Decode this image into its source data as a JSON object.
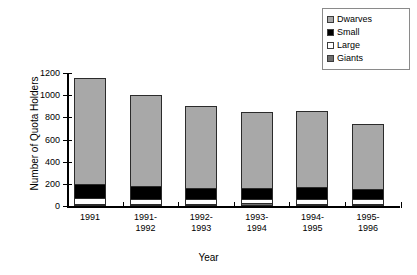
{
  "chart_data": {
    "type": "bar",
    "subtype": "stacked-bar",
    "title": "",
    "xlabel": "Year",
    "ylabel": "Number of Quota Holders",
    "categories": [
      "1991",
      "1991-\n1992",
      "1992-\n1993",
      "1993-\n1994",
      "1994-\n1995",
      "1995-\n1996"
    ],
    "category_lines": [
      [
        "1991"
      ],
      [
        "1991-",
        "1992"
      ],
      [
        "1992-",
        "1993"
      ],
      [
        "1993-",
        "1994"
      ],
      [
        "1994-",
        "1995"
      ],
      [
        "1995-",
        "1996"
      ]
    ],
    "ylim": [
      0,
      1200
    ],
    "yticks": [
      0,
      200,
      400,
      600,
      800,
      1000,
      1200
    ],
    "ytick_labels": [
      "0",
      "200",
      "400",
      "600",
      "800",
      "1000",
      "1200"
    ],
    "grid": false,
    "legend_position": "top-right",
    "stack_order_bottom_to_top": [
      "Giants",
      "Large",
      "Small",
      "Dwarves"
    ],
    "series": [
      {
        "name": "Giants",
        "color": "#6e6e6e",
        "values": [
          18,
          18,
          20,
          28,
          20,
          20
        ]
      },
      {
        "name": "Large",
        "color": "#ffffff",
        "values": [
          54,
          46,
          44,
          33,
          45,
          42
        ]
      },
      {
        "name": "Small",
        "color": "#000000",
        "values": [
          125,
          112,
          96,
          97,
          105,
          88
        ]
      },
      {
        "name": "Dwarves",
        "color": "#a8a8a8",
        "values": [
          958,
          824,
          740,
          692,
          690,
          590
        ]
      }
    ],
    "totals": [
      1155,
      1000,
      900,
      850,
      860,
      740
    ]
  },
  "legend": {
    "items": [
      {
        "label": "Dwarves",
        "color": "#a8a8a8"
      },
      {
        "label": "Small",
        "color": "#000000"
      },
      {
        "label": "Large",
        "color": "#ffffff"
      },
      {
        "label": "Giants",
        "color": "#6e6e6e"
      }
    ]
  }
}
